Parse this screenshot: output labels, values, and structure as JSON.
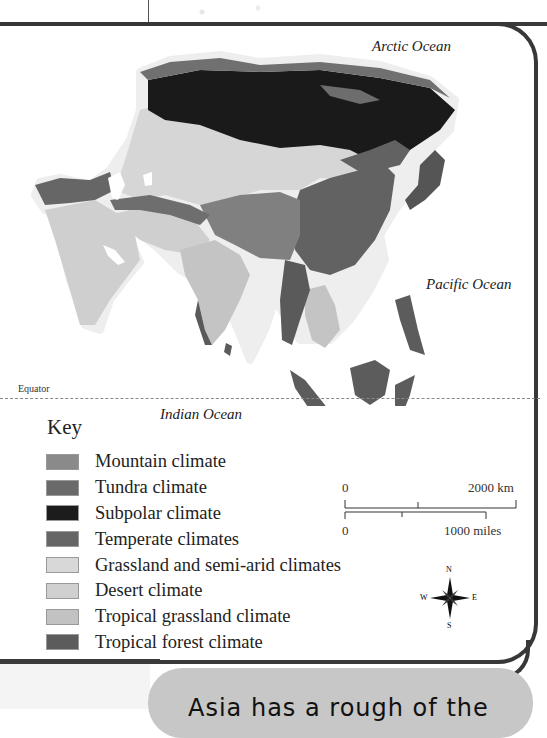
{
  "map": {
    "title_hint": "Climate map of Asia",
    "oceans": {
      "arctic": "Arctic Ocean",
      "pacific": "Pacific Ocean",
      "indian": "Indian Ocean"
    },
    "equator_label": "Equator"
  },
  "key": {
    "title": "Key",
    "items": [
      {
        "label": "Mountain climate",
        "color": "#8a8a8a"
      },
      {
        "label": "Tundra climate",
        "color": "#6a6a6a"
      },
      {
        "label": "Subpolar climate",
        "color": "#1c1c1c"
      },
      {
        "label": "Temperate climates",
        "color": "#666666"
      },
      {
        "label": "Grassland and semi-arid climates",
        "color": "#d8d8d8"
      },
      {
        "label": "Desert climate",
        "color": "#d0d0d0"
      },
      {
        "label": "Tropical grassland climate",
        "color": "#c2c2c2"
      },
      {
        "label": "Tropical forest climate",
        "color": "#5c5c5c"
      }
    ]
  },
  "scale": {
    "km_start": "0",
    "km_end": "2000 km",
    "miles_start": "0",
    "miles_end": "1000 miles"
  },
  "compass": {
    "n": "N",
    "s": "S",
    "e": "E",
    "w": "W"
  },
  "bubble": {
    "text": "Asia has a rough of the"
  },
  "colors": {
    "frame": "#383838",
    "bubble": "#c7c7c7"
  }
}
